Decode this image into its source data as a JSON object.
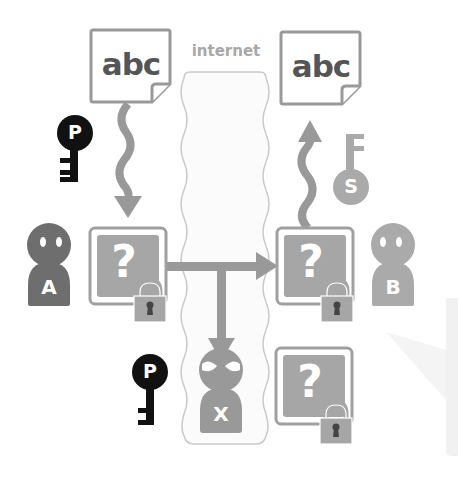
{
  "diagram": {
    "internet_label": "internet",
    "sender_document": {
      "text": "abc"
    },
    "receiver_document": {
      "text": "abc"
    },
    "sender": {
      "label": "A"
    },
    "receiver": {
      "label": "B"
    },
    "eavesdropper": {
      "label": "X"
    },
    "public_key_sender": {
      "label": "P"
    },
    "public_key_eavesdropper": {
      "label": "P"
    },
    "secret_key_receiver": {
      "label": "S"
    },
    "encrypted_box_sender": {
      "glyph": "?"
    },
    "encrypted_box_receiver": {
      "glyph": "?"
    },
    "encrypted_box_intercepted": {
      "glyph": "?"
    },
    "colors": {
      "dark": "#111111",
      "medium_gray": "#777777",
      "light_gray": "#a9a9a9",
      "box_fill": "#a0a0a0",
      "internet_fill": "#fbfbfb",
      "internet_border": "#c9c9c9"
    }
  }
}
